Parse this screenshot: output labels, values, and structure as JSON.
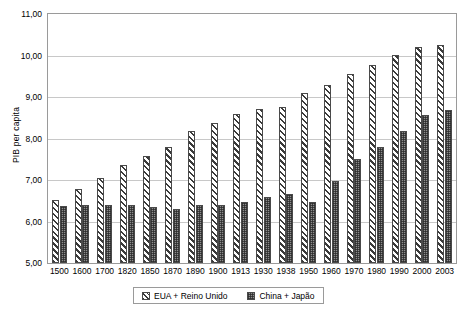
{
  "chart_data": {
    "type": "bar",
    "title": "",
    "xlabel": "",
    "ylabel": "PIB per capita",
    "ylim": [
      5.0,
      11.0
    ],
    "ytick_step": 1.0,
    "ytick_labels": [
      "11,00",
      "10,00",
      "9,00",
      "8,00",
      "7,00",
      "6,00",
      "5,00"
    ],
    "ytick_values": [
      11.0,
      10.0,
      9.0,
      8.0,
      7.0,
      6.0,
      5.0
    ],
    "grid": true,
    "legend_position": "bottom-center",
    "categories": [
      "1500",
      "1600",
      "1700",
      "1820",
      "1850",
      "1870",
      "1890",
      "1900",
      "1913",
      "1930",
      "1938",
      "1950",
      "1960",
      "1970",
      "1980",
      "1990",
      "2000",
      "2003"
    ],
    "series": [
      {
        "name": "EUA + Reino Unido",
        "pattern": "diagonal-hatch",
        "values": [
          6.53,
          6.79,
          7.05,
          7.35,
          7.58,
          7.79,
          8.18,
          8.38,
          8.59,
          8.7,
          8.77,
          9.1,
          9.28,
          9.55,
          9.77,
          10.02,
          10.2,
          10.25
        ]
      },
      {
        "name": "China + Japão",
        "pattern": "cross-hatch",
        "values": [
          6.37,
          6.39,
          6.39,
          6.4,
          6.36,
          6.31,
          6.4,
          6.39,
          6.48,
          6.6,
          6.66,
          6.46,
          6.98,
          7.5,
          7.79,
          8.19,
          8.56,
          8.69
        ]
      }
    ],
    "colors": {
      "series_a_fill": "#ffffff",
      "series_a_hatch": "#3a3a3a",
      "series_b_fill": "#8d8d8d",
      "series_b_hatch": "#282828",
      "gridline": "#c8c8c8",
      "frame": "#9a9a9a",
      "text": "#000000"
    }
  },
  "legend": {
    "entries": [
      {
        "label": "EUA + Reino Unido"
      },
      {
        "label": "China + Japão"
      }
    ]
  }
}
